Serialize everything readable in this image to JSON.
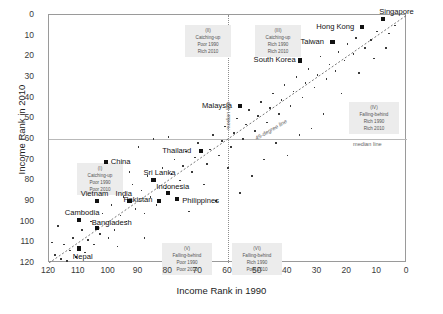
{
  "chart_data": {
    "type": "scatter",
    "title": "",
    "xlabel": "Income Rank in 1990",
    "ylabel": "Income Rank in 2010",
    "xlim": [
      120,
      0
    ],
    "ylim": [
      120,
      0
    ],
    "x_ticks": [
      120,
      110,
      100,
      90,
      80,
      70,
      60,
      50,
      40,
      30,
      20,
      10,
      0
    ],
    "y_ticks": [
      0,
      10,
      20,
      30,
      40,
      50,
      60,
      70,
      80,
      90,
      100,
      110,
      120
    ],
    "grid": false,
    "legend": "none",
    "x_axis_reversed": true,
    "y_axis_reversed": true,
    "reference_lines": [
      {
        "name": "median-line-vertical",
        "label": "median line",
        "orientation": "vertical",
        "x": 60
      },
      {
        "name": "median-line-horizontal",
        "label": "median line",
        "orientation": "horizontal",
        "y": 60
      },
      {
        "name": "forty-five-degree-line",
        "label": "45-degree line",
        "orientation": "diagonal"
      }
    ],
    "labeled_points": [
      {
        "name": "Singapore",
        "x": 8,
        "y": 2
      },
      {
        "name": "Hong Kong",
        "x": 15,
        "y": 6
      },
      {
        "name": "Taiwan",
        "x": 25,
        "y": 13
      },
      {
        "name": "South Korea",
        "x": 36,
        "y": 22
      },
      {
        "name": "Malaysia",
        "x": 56,
        "y": 44
      },
      {
        "name": "Thailand",
        "x": 69,
        "y": 66
      },
      {
        "name": "China",
        "x": 101,
        "y": 71
      },
      {
        "name": "Sri Lanka",
        "x": 85,
        "y": 80
      },
      {
        "name": "Indonesia",
        "x": 80,
        "y": 86
      },
      {
        "name": "Philippines",
        "x": 77,
        "y": 89
      },
      {
        "name": "Pakistan",
        "x": 83,
        "y": 90
      },
      {
        "name": "India",
        "x": 93,
        "y": 90
      },
      {
        "name": "Vietnam",
        "x": 104,
        "y": 90
      },
      {
        "name": "Cambodia",
        "x": 110,
        "y": 99
      },
      {
        "name": "Bangladesh",
        "x": 104,
        "y": 103
      },
      {
        "name": "Nepal",
        "x": 110,
        "y": 113
      }
    ],
    "other_points": [
      {
        "x": 4,
        "y": 5
      },
      {
        "x": 6,
        "y": 9
      },
      {
        "x": 10,
        "y": 8
      },
      {
        "x": 12,
        "y": 12
      },
      {
        "x": 14,
        "y": 16
      },
      {
        "x": 17,
        "y": 11
      },
      {
        "x": 18,
        "y": 19
      },
      {
        "x": 20,
        "y": 14
      },
      {
        "x": 21,
        "y": 22
      },
      {
        "x": 23,
        "y": 18
      },
      {
        "x": 24,
        "y": 27
      },
      {
        "x": 26,
        "y": 24
      },
      {
        "x": 27,
        "y": 31
      },
      {
        "x": 29,
        "y": 20
      },
      {
        "x": 30,
        "y": 29
      },
      {
        "x": 31,
        "y": 35
      },
      {
        "x": 33,
        "y": 26
      },
      {
        "x": 34,
        "y": 33
      },
      {
        "x": 35,
        "y": 40
      },
      {
        "x": 37,
        "y": 30
      },
      {
        "x": 38,
        "y": 37
      },
      {
        "x": 39,
        "y": 44
      },
      {
        "x": 41,
        "y": 34
      },
      {
        "x": 42,
        "y": 41
      },
      {
        "x": 43,
        "y": 48
      },
      {
        "x": 45,
        "y": 38
      },
      {
        "x": 46,
        "y": 45
      },
      {
        "x": 47,
        "y": 52
      },
      {
        "x": 49,
        "y": 42
      },
      {
        "x": 50,
        "y": 49
      },
      {
        "x": 51,
        "y": 56
      },
      {
        "x": 53,
        "y": 46
      },
      {
        "x": 54,
        "y": 53
      },
      {
        "x": 55,
        "y": 60
      },
      {
        "x": 57,
        "y": 50
      },
      {
        "x": 58,
        "y": 57
      },
      {
        "x": 59,
        "y": 64
      },
      {
        "x": 61,
        "y": 54
      },
      {
        "x": 62,
        "y": 61
      },
      {
        "x": 63,
        "y": 68
      },
      {
        "x": 65,
        "y": 58
      },
      {
        "x": 66,
        "y": 65
      },
      {
        "x": 67,
        "y": 72
      },
      {
        "x": 70,
        "y": 62
      },
      {
        "x": 71,
        "y": 69
      },
      {
        "x": 72,
        "y": 76
      },
      {
        "x": 74,
        "y": 66
      },
      {
        "x": 75,
        "y": 73
      },
      {
        "x": 76,
        "y": 80
      },
      {
        "x": 78,
        "y": 70
      },
      {
        "x": 79,
        "y": 77
      },
      {
        "x": 81,
        "y": 84
      },
      {
        "x": 82,
        "y": 74
      },
      {
        "x": 84,
        "y": 92
      },
      {
        "x": 86,
        "y": 88
      },
      {
        "x": 87,
        "y": 78
      },
      {
        "x": 88,
        "y": 96
      },
      {
        "x": 89,
        "y": 85
      },
      {
        "x": 91,
        "y": 94
      },
      {
        "x": 92,
        "y": 82
      },
      {
        "x": 94,
        "y": 100
      },
      {
        "x": 95,
        "y": 88
      },
      {
        "x": 96,
        "y": 97
      },
      {
        "x": 98,
        "y": 104
      },
      {
        "x": 99,
        "y": 92
      },
      {
        "x": 100,
        "y": 108
      },
      {
        "x": 102,
        "y": 96
      },
      {
        "x": 103,
        "y": 106
      },
      {
        "x": 105,
        "y": 111
      },
      {
        "x": 106,
        "y": 100
      },
      {
        "x": 107,
        "y": 109
      },
      {
        "x": 108,
        "y": 115
      },
      {
        "x": 109,
        "y": 104
      },
      {
        "x": 111,
        "y": 117
      },
      {
        "x": 112,
        "y": 108
      },
      {
        "x": 113,
        "y": 114
      },
      {
        "x": 114,
        "y": 119
      },
      {
        "x": 115,
        "y": 111
      },
      {
        "x": 116,
        "y": 118
      },
      {
        "x": 118,
        "y": 116
      },
      {
        "x": 44,
        "y": 62
      },
      {
        "x": 48,
        "y": 70
      },
      {
        "x": 52,
        "y": 78
      },
      {
        "x": 56,
        "y": 86
      },
      {
        "x": 60,
        "y": 74
      },
      {
        "x": 64,
        "y": 90
      },
      {
        "x": 68,
        "y": 82
      },
      {
        "x": 73,
        "y": 95
      },
      {
        "x": 28,
        "y": 48
      },
      {
        "x": 32,
        "y": 55
      },
      {
        "x": 36,
        "y": 58
      },
      {
        "x": 40,
        "y": 68
      },
      {
        "x": 22,
        "y": 38
      },
      {
        "x": 16,
        "y": 28
      },
      {
        "x": 11,
        "y": 21
      },
      {
        "x": 7,
        "y": 16
      },
      {
        "x": 90,
        "y": 64
      },
      {
        "x": 97,
        "y": 112
      },
      {
        "x": 117,
        "y": 102
      },
      {
        "x": 119,
        "y": 110
      },
      {
        "x": 85,
        "y": 60
      },
      {
        "x": 80,
        "y": 59
      },
      {
        "x": 93,
        "y": 76
      },
      {
        "x": 88,
        "y": 108
      }
    ]
  },
  "quadrants": [
    {
      "id": "I",
      "title": "Catching-up",
      "line1": "Poor 1990",
      "line2": "Poor 2010"
    },
    {
      "id": "II",
      "title": "Catching-up",
      "line1": "Poor 1990",
      "line2": "Rich 2010"
    },
    {
      "id": "III",
      "title": "Catching-up",
      "line1": "Rich 1990",
      "line2": "Rich 2010"
    },
    {
      "id": "IV",
      "title": "Falling-behind",
      "line1": "Rich 1990",
      "line2": "Rich 2010"
    },
    {
      "id": "V",
      "title": "Falling-behind",
      "line1": "Poor 1990",
      "line2": "Poor 2010"
    },
    {
      "id": "VI",
      "title": "Falling-behind",
      "line1": "Rich 1990",
      "line2": "Poor 2010"
    }
  ]
}
